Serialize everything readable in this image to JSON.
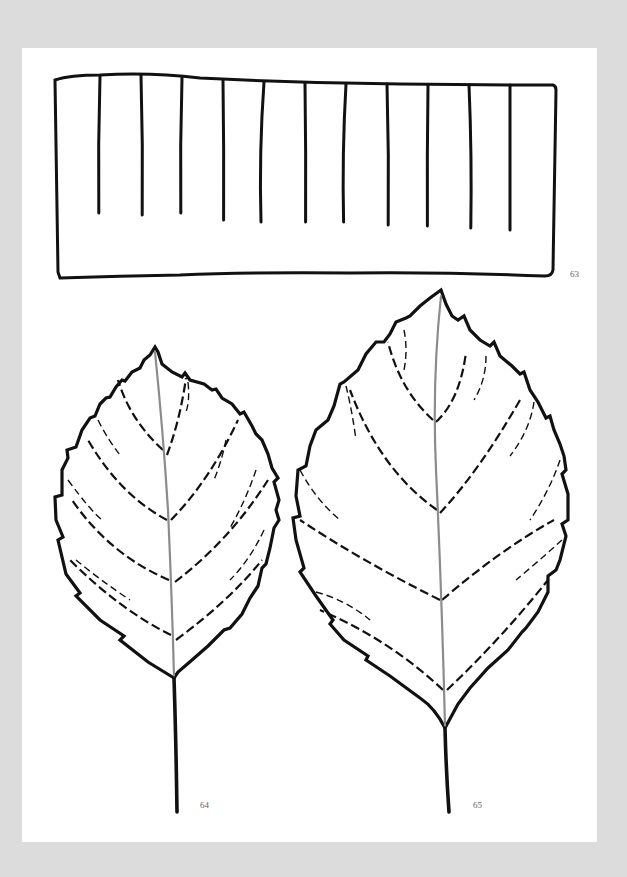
{
  "page": {
    "background_color": "#dcdcdc",
    "paper_color": "#ffffff",
    "ink_color": "#111111",
    "midrib_color": "#8c8c8c"
  },
  "figures": [
    {
      "id": "63",
      "label": "63",
      "subject": "rectangle-with-vertical-lines",
      "vertical_line_count": 11
    },
    {
      "id": "64",
      "label": "64",
      "subject": "serrated-leaf-small"
    },
    {
      "id": "65",
      "label": "65",
      "subject": "serrated-leaf-large"
    }
  ]
}
